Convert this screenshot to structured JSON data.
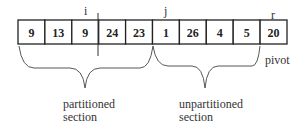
{
  "array": {
    "cells": [
      "9",
      "13",
      "9",
      "24",
      "23",
      "1",
      "26",
      "4",
      "5",
      "20"
    ],
    "left": 18,
    "top": 20,
    "cell_width": 26.9,
    "height": 24
  },
  "markers": {
    "i": "i",
    "j": "j",
    "r": "r",
    "pivot": "pivot"
  },
  "sections": {
    "partitioned_line1": "partitioned",
    "partitioned_line2": "section",
    "unpartitioned_line1": "unpartitioned",
    "unpartitioned_line2": "section"
  },
  "colors": {
    "stroke": "#222222",
    "text": "#222222"
  }
}
